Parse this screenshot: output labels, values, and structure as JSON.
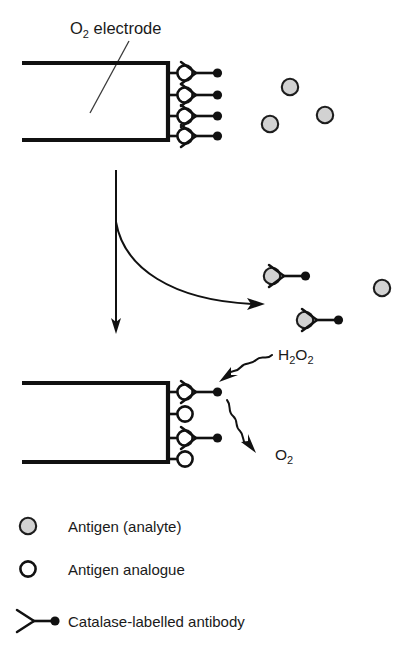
{
  "figure": {
    "title_label": {
      "text_main": "O",
      "text_sub": "2",
      "text_rest": " electrode"
    },
    "chem_labels": {
      "hydrogen_peroxide": {
        "main": "H",
        "sub1": "2",
        "mid": "O",
        "sub2": "2"
      },
      "oxygen": {
        "main": "O",
        "sub": "2"
      }
    }
  },
  "legend": {
    "items": [
      {
        "symbol": "antigen-analyte-icon",
        "label": "Antigen (analyte)"
      },
      {
        "symbol": "antigen-analogue-icon",
        "label": "Antigen analogue"
      },
      {
        "symbol": "catalase-labelled-antibody-icon",
        "label": "Catalase-labelled antibody"
      }
    ]
  },
  "colors": {
    "ink": "#111111",
    "antigen_fill": "#d2d2d2",
    "antigen_stroke": "#1d1d1d",
    "analogue_fill": "#ffffff",
    "background": "#ffffff"
  },
  "panels": {
    "top": {
      "name": "electrode-before-competition",
      "electrode": {
        "x_left": 22,
        "x_right": 168,
        "y_top": 63,
        "y_bottom": 140
      },
      "bound_sites": 4,
      "bound_sites_with_antibody": 4,
      "free_antigens": [
        {
          "cx": 290,
          "cy": 87
        },
        {
          "cx": 325,
          "cy": 115
        },
        {
          "cx": 270,
          "cy": 124
        }
      ]
    },
    "middle": {
      "name": "competition-step",
      "vertical_arrow": {
        "x": 116,
        "y_start": 170,
        "y_end": 332
      },
      "curved_arrow": {
        "x_start": 116,
        "y_start": 222,
        "x_end": 263,
        "y_end": 304
      },
      "released_complexes": [
        {
          "cx": 272,
          "cy": 276
        },
        {
          "cx": 305,
          "cy": 320
        }
      ],
      "free_antigens": [
        {
          "cx": 382,
          "cy": 288
        }
      ]
    },
    "bottom": {
      "name": "electrode-after-competition",
      "electrode": {
        "x_left": 22,
        "x_right": 168,
        "y_top": 383,
        "y_bottom": 462
      },
      "bound_sites": 4,
      "bound_sites_with_antibody": 2,
      "antibody_rows": [
        1,
        3
      ]
    }
  }
}
